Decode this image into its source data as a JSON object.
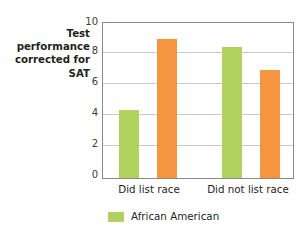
{
  "chart_data": {
    "type": "bar",
    "title": "",
    "ylabel": "Test\nperformance\ncorrected for\nSAT",
    "xlabel": "",
    "categories": [
      "Did list race",
      "Did not list race"
    ],
    "series": [
      {
        "name": "African American",
        "color": "#b2d25f",
        "values": [
          4.4,
          8.45
        ]
      },
      {
        "name": "",
        "color": "#f5953f",
        "values": [
          9.0,
          7.0
        ]
      }
    ],
    "ylim": [
      0,
      10
    ],
    "yticks": [
      "0",
      "2",
      "4",
      "6",
      "8",
      "10"
    ],
    "ytick_values": [
      0,
      2,
      4,
      6,
      8,
      10
    ],
    "grid": true,
    "legend_position": "bottom",
    "legend": [
      {
        "label": "African American",
        "color": "#b2d25f"
      }
    ]
  },
  "colors": {
    "series_green": "#b2d25f",
    "series_orange": "#f5953f",
    "axis": "#8a8a8a",
    "grid": "#c9c9c9",
    "text": "#231f20",
    "background": "#ffffff"
  }
}
